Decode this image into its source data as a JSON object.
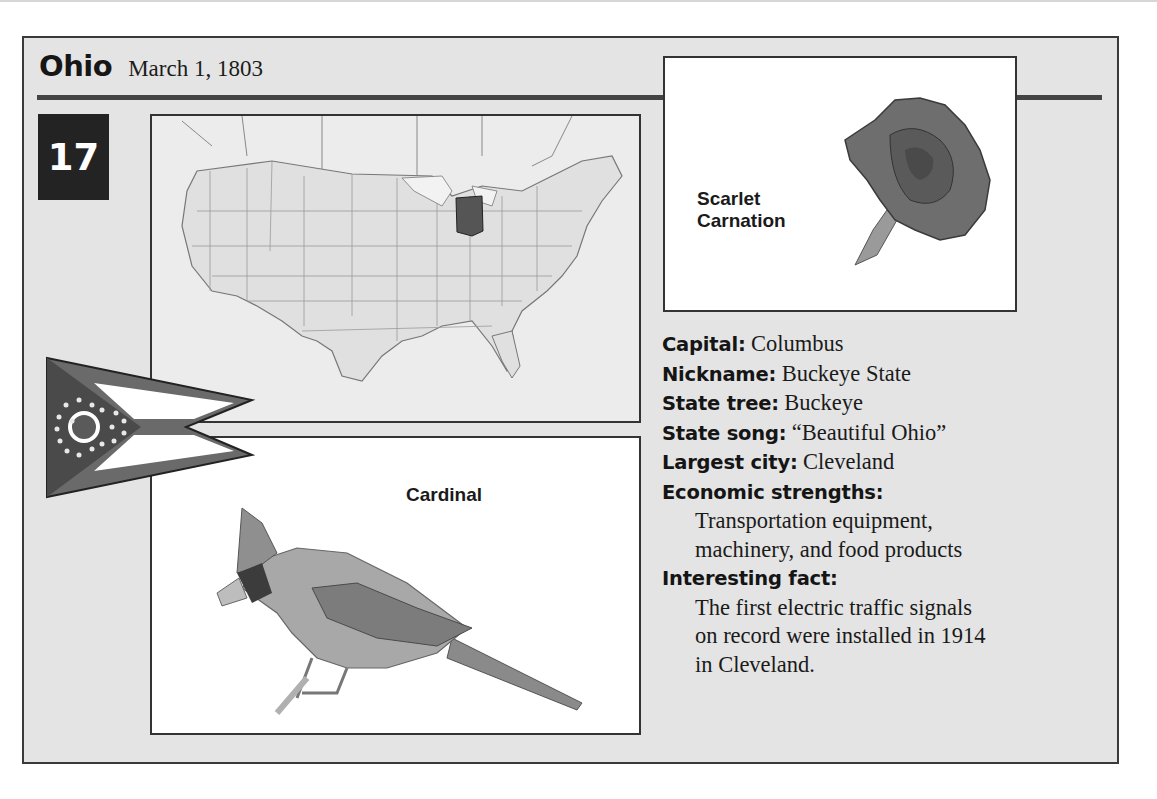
{
  "header": {
    "state_name": "Ohio",
    "admission_date": "March 1, 1803",
    "statehood_order": "17"
  },
  "map": {
    "description": "Map of the contiguous United States with Ohio highlighted",
    "highlighted_state": "Ohio",
    "highlight_color": "#555555",
    "base_color": "#e0e0e0"
  },
  "flower": {
    "caption_line1": "Scarlet",
    "caption_line2": "Carnation"
  },
  "bird": {
    "caption": "Cardinal"
  },
  "flag": {
    "description": "Ohio burgee (swallowtail pennant) with circle and 17 stars"
  },
  "facts": {
    "capital": {
      "label": "Capital:",
      "value": "Columbus"
    },
    "nickname": {
      "label": "Nickname:",
      "value": "Buckeye State"
    },
    "state_tree": {
      "label": "State tree:",
      "value": "Buckeye"
    },
    "state_song": {
      "label": "State song:",
      "value": "“Beautiful Ohio”"
    },
    "largest_city": {
      "label": "Largest city:",
      "value": "Cleveland"
    },
    "economic_strengths": {
      "label": "Economic strengths:",
      "lines": [
        "Transportation equipment,",
        "machinery, and food products"
      ]
    },
    "interesting_fact": {
      "label": "Interesting fact:",
      "lines": [
        "The first electric traffic signals",
        "on record were installed in 1914",
        "in Cleveland."
      ]
    }
  },
  "colors": {
    "card_background": "#e4e4e4",
    "border": "#333333",
    "badge_background": "#232323",
    "badge_text": "#ffffff"
  }
}
